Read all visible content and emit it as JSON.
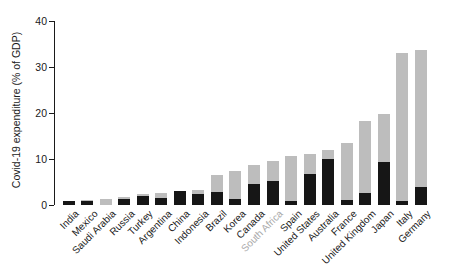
{
  "chart_data": {
    "type": "bar",
    "stacked": true,
    "title": "",
    "ylabel": "Covid-19 expenditure (% of GDP)",
    "xlabel": "",
    "ylim": [
      0,
      40
    ],
    "yticks": [
      0,
      10,
      20,
      30,
      40
    ],
    "grid": false,
    "legend": "none",
    "categories": [
      "India",
      "Mexico",
      "Saudi Arabia",
      "Russia",
      "Turkey",
      "Argentina",
      "China",
      "Indonesia",
      "Brazil",
      "Korea",
      "Canada",
      "South Africa",
      "Spain",
      "United States",
      "Australia",
      "France",
      "United Kingdom",
      "Japan",
      "Italy",
      "Germany"
    ],
    "series": [
      {
        "name": "dark-segment",
        "color": "#161616",
        "values": [
          0.9,
          0.9,
          0.0,
          1.3,
          2.0,
          1.6,
          3.0,
          2.5,
          2.8,
          1.2,
          4.6,
          5.3,
          0.9,
          6.8,
          10.1,
          1.1,
          2.7,
          9.3,
          0.9,
          3.9
        ]
      },
      {
        "name": "light-segment",
        "color": "#bdbdbd",
        "values": [
          0.0,
          0.1,
          1.4,
          0.4,
          0.5,
          1.1,
          0.0,
          0.8,
          3.8,
          6.3,
          4.2,
          4.3,
          9.7,
          4.2,
          1.9,
          12.4,
          15.5,
          10.5,
          32.1,
          29.9
        ]
      }
    ],
    "totals": [
      0.9,
      1.0,
      1.4,
      1.7,
      2.5,
      2.7,
      3.0,
      3.3,
      6.6,
      7.5,
      8.8,
      9.6,
      10.6,
      11.0,
      12.0,
      13.5,
      18.2,
      19.8,
      33.0,
      33.8
    ],
    "highlighted_category": "South Africa",
    "highlight_label_color": "#a8a8a8",
    "label_color": "#1a1a1a",
    "axis_color": "#1a1a1a",
    "x_label_rotation_deg": 45
  }
}
